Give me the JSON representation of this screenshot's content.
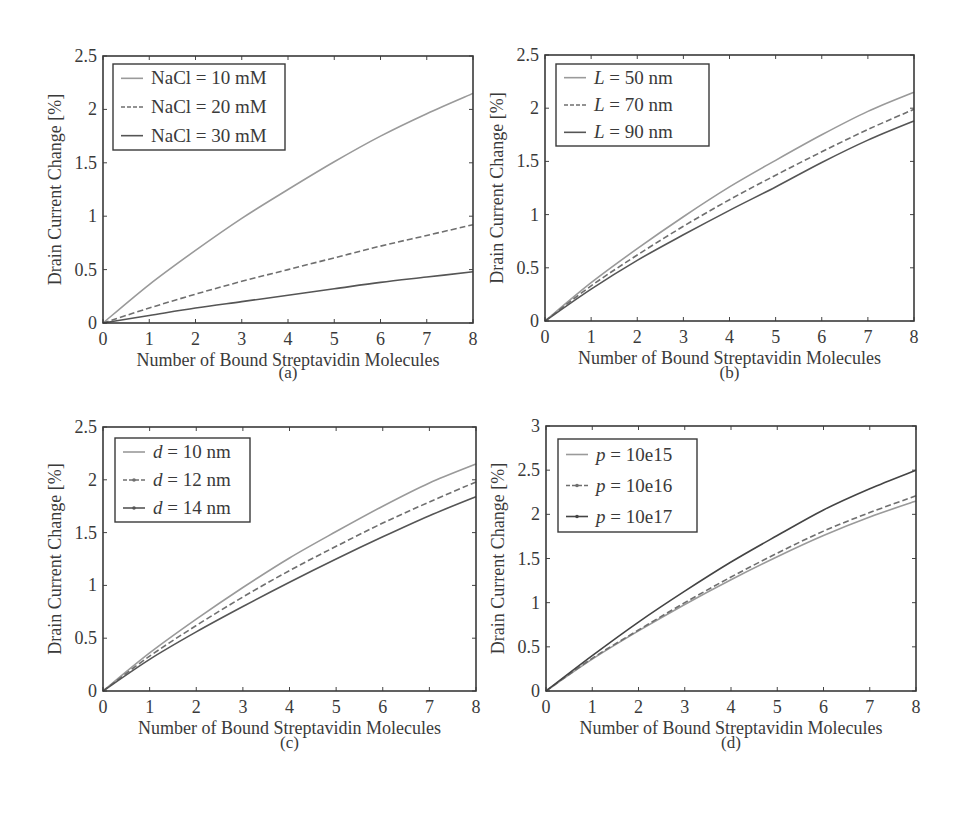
{
  "figure": {
    "panels": [
      "(a)",
      "(b)",
      "(c)",
      "(d)"
    ]
  },
  "chart_data": [
    {
      "id": "a",
      "type": "line",
      "caption": "(a)",
      "xlabel": "Number of Bound Streptavidin Molecules",
      "ylabel": "Drain Current Change [%]",
      "xlim": [
        0,
        8
      ],
      "ylim": [
        0,
        2.5
      ],
      "xticks": [
        "0",
        "1",
        "2",
        "3",
        "4",
        "5",
        "6",
        "7",
        "8"
      ],
      "yticks": [
        "0",
        "0.5",
        "1",
        "1.5",
        "2",
        "2.5"
      ],
      "grid": false,
      "legend_position": "upper left",
      "x": [
        0,
        1,
        2,
        3,
        4,
        5,
        6,
        7,
        8
      ],
      "series": [
        {
          "name": "NaCl = 10 mM",
          "style": "solid",
          "color": "#9a9a9a",
          "values": [
            0,
            0.36,
            0.68,
            0.98,
            1.25,
            1.51,
            1.75,
            1.96,
            2.15
          ]
        },
        {
          "name": "NaCl = 20 mM",
          "style": "dashed",
          "color": "#6f6f6f",
          "values": [
            0,
            0.14,
            0.27,
            0.39,
            0.5,
            0.61,
            0.72,
            0.82,
            0.92
          ]
        },
        {
          "name": "NaCl = 30 mM",
          "style": "solid",
          "color": "#555555",
          "values": [
            0,
            0.07,
            0.14,
            0.2,
            0.26,
            0.32,
            0.38,
            0.43,
            0.48
          ]
        }
      ]
    },
    {
      "id": "b",
      "type": "line",
      "caption": "(b)",
      "xlabel": "Number of Bound Streptavidin Molecules",
      "ylabel": "Drain Current Change [%]",
      "xlim": [
        0,
        8
      ],
      "ylim": [
        0,
        2.5
      ],
      "xticks": [
        "0",
        "1",
        "2",
        "3",
        "4",
        "5",
        "6",
        "7",
        "8"
      ],
      "yticks": [
        "0",
        "0.5",
        "1",
        "1.5",
        "2",
        "2.5"
      ],
      "grid": false,
      "legend_position": "upper left",
      "x": [
        0,
        1,
        2,
        3,
        4,
        5,
        6,
        7,
        8
      ],
      "series": [
        {
          "name": "L = 50 nm",
          "italic_var": "L",
          "rest": " = 50 nm",
          "style": "solid",
          "color": "#9a9a9a",
          "values": [
            0,
            0.36,
            0.68,
            0.98,
            1.26,
            1.51,
            1.75,
            1.97,
            2.15
          ]
        },
        {
          "name": "L = 70 nm",
          "italic_var": "L",
          "rest": " = 70 nm",
          "style": "dashed",
          "color": "#6f6f6f",
          "values": [
            0,
            0.33,
            0.62,
            0.89,
            1.14,
            1.37,
            1.59,
            1.8,
            1.99
          ]
        },
        {
          "name": "L = 90 nm",
          "italic_var": "L",
          "rest": " = 90 nm",
          "style": "solid",
          "color": "#555555",
          "values": [
            0,
            0.3,
            0.57,
            0.81,
            1.04,
            1.26,
            1.49,
            1.7,
            1.88
          ]
        }
      ]
    },
    {
      "id": "c",
      "type": "line",
      "caption": "(c)",
      "xlabel": "Number of Bound Streptavidin Molecules",
      "ylabel": "Drain Current Change [%]",
      "xlim": [
        0,
        8
      ],
      "ylim": [
        0,
        2.5
      ],
      "xticks": [
        "0",
        "1",
        "2",
        "3",
        "4",
        "5",
        "6",
        "7",
        "8"
      ],
      "yticks": [
        "0",
        "0.5",
        "1",
        "1.5",
        "2",
        "2.5"
      ],
      "grid": false,
      "legend_position": "upper left",
      "x": [
        0,
        1,
        2,
        3,
        4,
        5,
        6,
        7,
        8
      ],
      "series": [
        {
          "name": "d = 10 nm",
          "italic_var": "d",
          "rest": " = 10 nm",
          "style": "solid",
          "color": "#9a9a9a",
          "values": [
            0,
            0.36,
            0.68,
            0.98,
            1.26,
            1.51,
            1.75,
            1.97,
            2.15
          ]
        },
        {
          "name": "d = 12 nm",
          "italic_var": "d",
          "rest": " = 12 nm",
          "style": "dash-dot-marker",
          "color": "#6f6f6f",
          "values": [
            0,
            0.33,
            0.62,
            0.89,
            1.14,
            1.37,
            1.59,
            1.79,
            1.98
          ]
        },
        {
          "name": "d = 14 nm",
          "italic_var": "d",
          "rest": " = 14 nm",
          "style": "solid-marker",
          "color": "#555555",
          "values": [
            0,
            0.3,
            0.56,
            0.8,
            1.03,
            1.25,
            1.46,
            1.66,
            1.84
          ]
        }
      ]
    },
    {
      "id": "d",
      "type": "line",
      "caption": "(d)",
      "xlabel": "Number of Bound Streptavidin Molecules",
      "ylabel": "Drain Current Change [%]",
      "xlim": [
        0,
        8
      ],
      "ylim": [
        0,
        3
      ],
      "xticks": [
        "0",
        "1",
        "2",
        "3",
        "4",
        "5",
        "6",
        "7",
        "8"
      ],
      "yticks": [
        "0",
        "0.5",
        "1",
        "1.5",
        "2",
        "2.5",
        "3"
      ],
      "grid": false,
      "legend_position": "upper left",
      "x": [
        0,
        1,
        2,
        3,
        4,
        5,
        6,
        7,
        8
      ],
      "series": [
        {
          "name": "p = 10e15",
          "italic_var": "p",
          "rest": " = 10e15",
          "style": "solid",
          "color": "#9a9a9a",
          "values": [
            0,
            0.36,
            0.68,
            0.98,
            1.26,
            1.52,
            1.76,
            1.97,
            2.15
          ]
        },
        {
          "name": "p = 10e16",
          "italic_var": "p",
          "rest": " = 10e16",
          "style": "dash-dot-marker",
          "color": "#6f6f6f",
          "values": [
            0,
            0.37,
            0.69,
            1.0,
            1.29,
            1.56,
            1.81,
            2.02,
            2.21
          ]
        },
        {
          "name": "p = 10e17",
          "italic_var": "p",
          "rest": " = 10e17",
          "style": "solid-marker",
          "color": "#444444",
          "values": [
            0,
            0.4,
            0.78,
            1.13,
            1.46,
            1.76,
            2.05,
            2.29,
            2.5
          ]
        }
      ]
    }
  ]
}
